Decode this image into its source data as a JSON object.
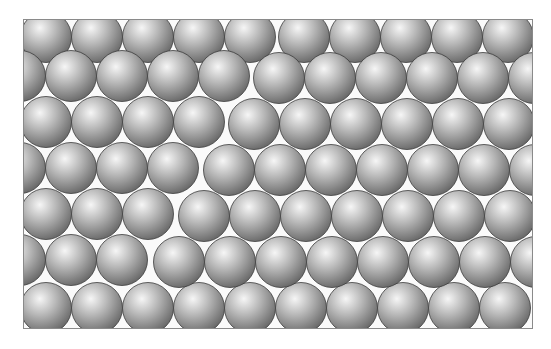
{
  "figure": {
    "frame": {
      "x": 23,
      "y": 19,
      "width": 510,
      "height": 310,
      "border_color": "#8a8a8a"
    },
    "sphere": {
      "radius": 25.5,
      "color_light": "#f4f4f4",
      "color_mid": "#b4b4b4",
      "color_dark": "#6e6e6e",
      "outline": "#3c3c3c"
    },
    "grains": [
      {
        "name": "left-grain",
        "rows": [
          {
            "y": 17,
            "xs": [
              22,
              73,
              124,
              175,
              226
            ]
          },
          {
            "y": 56,
            "xs": [
              -4,
              47,
              98,
              149,
              200
            ]
          },
          {
            "y": 102,
            "xs": [
              22,
              73,
              124,
              175
            ]
          },
          {
            "y": 148,
            "xs": [
              -4,
              47,
              98,
              149
            ]
          },
          {
            "y": 194,
            "xs": [
              22,
              73,
              124
            ]
          },
          {
            "y": 240,
            "xs": [
              -4,
              47,
              98
            ]
          },
          {
            "y": 288,
            "xs": [
              22,
              73,
              124,
              175,
              226,
              277,
              328,
              379,
              430,
              481
            ]
          }
        ]
      },
      {
        "name": "right-grain",
        "rows": [
          {
            "y": 17,
            "xs": [
              280,
              331,
              382,
              433,
              484
            ]
          },
          {
            "y": 58,
            "xs": [
              255,
              306,
              357,
              408,
              459,
              510
            ]
          },
          {
            "y": 104,
            "xs": [
              230,
              281,
              332,
              383,
              434,
              485
            ]
          },
          {
            "y": 150,
            "xs": [
              205,
              256,
              307,
              358,
              409,
              460,
              511
            ]
          },
          {
            "y": 196,
            "xs": [
              180,
              231,
              282,
              333,
              384,
              435,
              486
            ]
          },
          {
            "y": 242,
            "xs": [
              155,
              206,
              257,
              308,
              359,
              410,
              461,
              512
            ]
          }
        ]
      }
    ]
  }
}
